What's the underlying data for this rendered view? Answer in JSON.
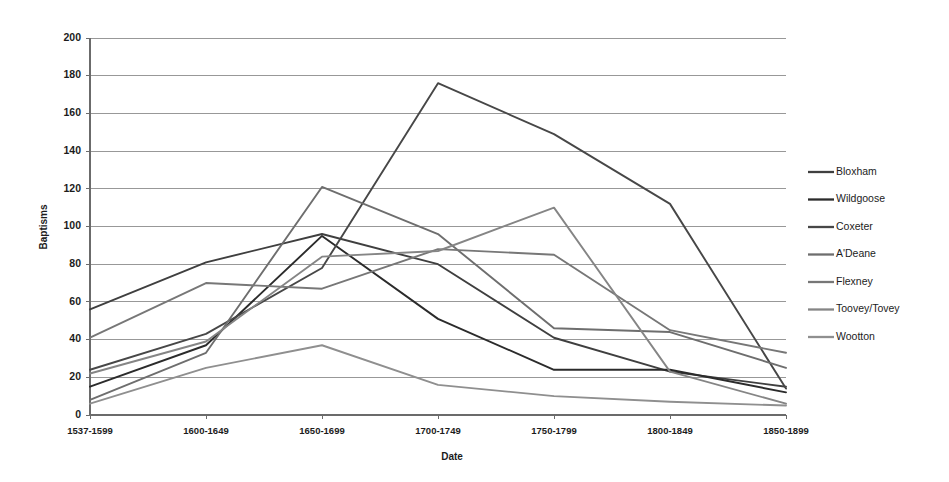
{
  "chart_data": {
    "type": "line",
    "title": "",
    "xlabel": "Date",
    "ylabel": "Baptisms",
    "categories": [
      "1537-1599",
      "1600-1649",
      "1650-1699",
      "1700-1749",
      "1750-1799",
      "1800-1849",
      "1850-1899"
    ],
    "ylim": [
      0,
      200
    ],
    "ytick_values": [
      0,
      20,
      40,
      60,
      80,
      100,
      120,
      140,
      160,
      180,
      200
    ],
    "ytick_labels": [
      "0",
      "20",
      "40",
      "60",
      "80",
      "100",
      "120",
      "140",
      "160",
      "180",
      "200"
    ],
    "grid": true,
    "legend_position": "right",
    "series": [
      {
        "name": "Bloxham",
        "color": "#3f3f3f",
        "values": [
          56,
          81,
          96,
          80,
          41,
          23,
          15
        ]
      },
      {
        "name": "Wildgoose",
        "color": "#2b2b2b",
        "values": [
          15,
          37,
          95,
          51,
          24,
          24,
          12
        ]
      },
      {
        "name": "Coxeter",
        "color": "#474747",
        "values": [
          24,
          43,
          78,
          176,
          149,
          112,
          14
        ]
      },
      {
        "name": "A'Deane",
        "color": "#6e6e6e",
        "values": [
          8,
          33,
          121,
          96,
          46,
          44,
          25
        ]
      },
      {
        "name": "Flexney",
        "color": "#777777",
        "values": [
          41,
          70,
          67,
          88,
          85,
          45,
          33
        ]
      },
      {
        "name": "Toovey/Tovey",
        "color": "#858585",
        "values": [
          22,
          39,
          84,
          87,
          110,
          23,
          6
        ]
      },
      {
        "name": "Wootton",
        "color": "#8f8f8f",
        "values": [
          6,
          25,
          37,
          16,
          10,
          7,
          5
        ]
      }
    ]
  },
  "legend": {
    "items": [
      "Bloxham",
      "Wildgoose",
      "Coxeter",
      "A'Deane",
      "Flexney",
      "Toovey/Tovey",
      "Wootton"
    ]
  }
}
